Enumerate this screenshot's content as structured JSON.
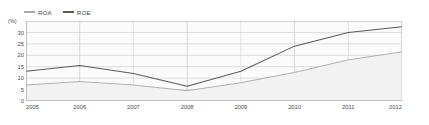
{
  "legend": {
    "position": "top-left",
    "entries": [
      {
        "label": "ROA",
        "color": "#a8a8a8",
        "icon": "line-swatch-icon"
      },
      {
        "label": "ROE",
        "color": "#5a5a5a",
        "icon": "line-swatch-icon"
      }
    ]
  },
  "axes": {
    "y_unit": "(%)",
    "y_ticks": [
      "35",
      "30",
      "25",
      "20",
      "15",
      "10",
      "5",
      "0"
    ],
    "x_ticks": [
      "2005",
      "2006",
      "2007",
      "2008",
      "2009",
      "2010",
      "2011",
      "2012"
    ]
  },
  "colors": {
    "roa_line": "#a8a8a8",
    "roe_line": "#5a5a5a",
    "grid": "#d0d0d0",
    "axis": "#808080",
    "plot_background": "#fbfbfb",
    "band_fill": "#f2f2f2",
    "text": "#4a4a4a"
  },
  "chart_data": {
    "type": "line",
    "title": "",
    "xlabel": "",
    "ylabel": "(%)",
    "categories": [
      "2005",
      "2006",
      "2007",
      "2008",
      "2009",
      "2010",
      "2011",
      "2012"
    ],
    "x": [
      2005,
      2006,
      2007,
      2008,
      2009,
      2010,
      2011,
      2012
    ],
    "ylim": [
      0,
      35
    ],
    "xlim": [
      2005,
      2012
    ],
    "ytick_step": 5,
    "grid": true,
    "legend_position": "top-left",
    "series": [
      {
        "name": "ROA",
        "color": "#a8a8a8",
        "values": [
          7.0,
          8.5,
          7.0,
          4.5,
          8.0,
          12.5,
          18.0,
          21.5
        ]
      },
      {
        "name": "ROE",
        "color": "#5a5a5a",
        "values": [
          13.0,
          15.5,
          12.0,
          6.5,
          13.0,
          24.0,
          30.0,
          32.5
        ]
      }
    ]
  }
}
